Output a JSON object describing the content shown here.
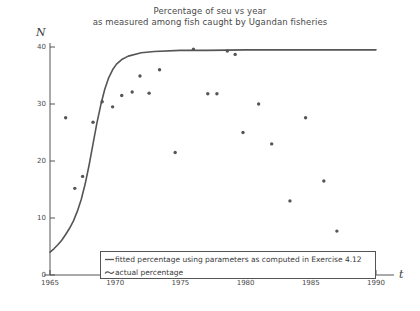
{
  "chart_data": {
    "type": "scatter",
    "title": "Percentage of seu vs year",
    "subtitle": "as measured among fish caught by Ugandan fisheries",
    "xlabel": "t",
    "ylabel": "N",
    "xlim": [
      1965,
      1990
    ],
    "ylim": [
      0,
      40
    ],
    "xticks": [
      1965,
      1970,
      1975,
      1980,
      1985,
      1990
    ],
    "yticks": [
      0,
      10,
      20,
      30,
      40
    ],
    "grid": false,
    "legend_position": "bottom",
    "series": [
      {
        "name": "fitted percentage using parameters as computed in Exercise 4.12",
        "type": "line",
        "marker": "line",
        "color": "#555555",
        "x": [
          1965.0,
          1965.3,
          1965.6,
          1965.9,
          1966.2,
          1966.5,
          1966.8,
          1967.1,
          1967.4,
          1967.7,
          1968.0,
          1968.3,
          1968.6,
          1968.9,
          1969.2,
          1969.5,
          1969.8,
          1970.1,
          1970.5,
          1971.0,
          1972.0,
          1973.0,
          1975.0,
          1977.0,
          1980.0,
          1985.0,
          1990.0
        ],
        "y": [
          4.0,
          4.6,
          5.3,
          6.1,
          7.1,
          8.2,
          9.5,
          11.2,
          13.3,
          16.0,
          19.3,
          23.0,
          26.7,
          29.9,
          32.6,
          34.6,
          36.0,
          37.0,
          37.8,
          38.4,
          39.0,
          39.2,
          39.4,
          39.4,
          39.5,
          39.5,
          39.5
        ]
      },
      {
        "name": "actual percentage",
        "type": "scatter",
        "marker": "dot",
        "color": "#555555",
        "x": [
          1966.2,
          1966.9,
          1967.5,
          1968.3,
          1969.0,
          1969.8,
          1970.5,
          1971.3,
          1971.9,
          1972.6,
          1973.4,
          1974.6,
          1976.0,
          1977.1,
          1977.8,
          1978.6,
          1979.2,
          1979.8,
          1981.0,
          1982.0,
          1983.4,
          1984.6,
          1986.0,
          1987.0
        ],
        "y": [
          27.6,
          15.2,
          17.3,
          26.8,
          30.4,
          29.5,
          31.5,
          32.1,
          34.9,
          31.9,
          36.0,
          21.5,
          39.6,
          31.8,
          31.8,
          39.3,
          38.7,
          25.0,
          30.0,
          23.0,
          13.0,
          27.6,
          16.5,
          7.7
        ]
      }
    ]
  },
  "legend": {
    "items": [
      {
        "label": "fitted percentage using parameters as computed in Exercise 4.12",
        "marker": "line"
      },
      {
        "label": "actual percentage",
        "marker": "dot"
      }
    ]
  },
  "colors": {
    "background": "#ffffff",
    "axis": "#555555",
    "text": "#3a3a3a",
    "curve": "#555555",
    "points": "#555555"
  }
}
